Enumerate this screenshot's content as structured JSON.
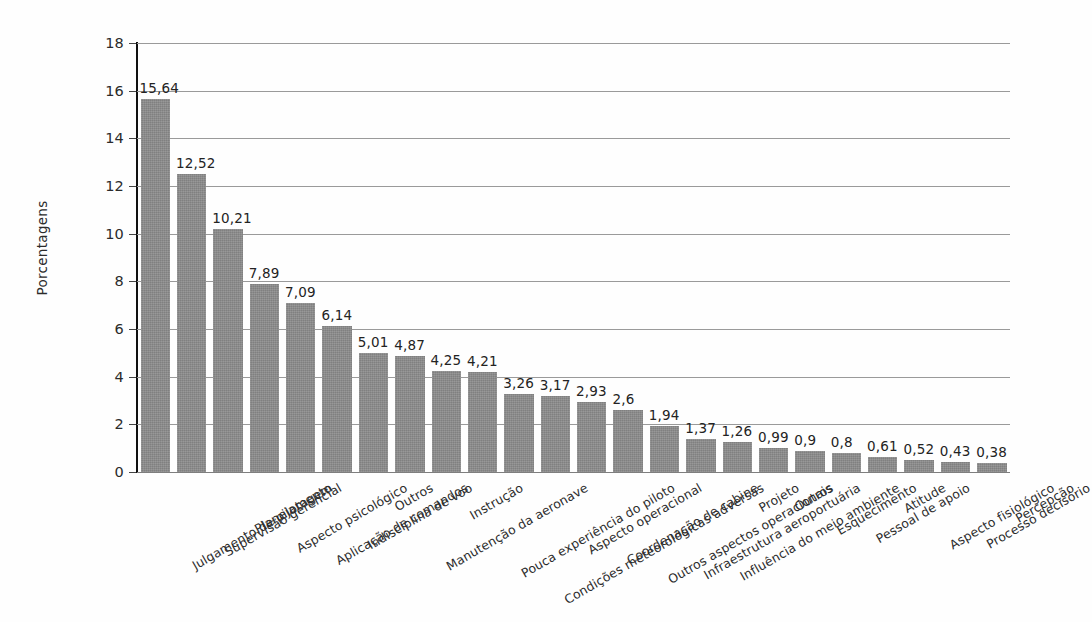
{
  "chart_data": {
    "type": "bar",
    "title": "",
    "subtitle": "",
    "xlabel": "",
    "ylabel": "Porcentagens",
    "ylim": [
      0,
      18
    ],
    "ytick_labels": [
      "0",
      "2",
      "4",
      "6",
      "8",
      "10",
      "12",
      "14",
      "16",
      "18"
    ],
    "yticks": [
      0,
      2,
      4,
      6,
      8,
      10,
      12,
      14,
      16,
      18
    ],
    "grid": "horizontal",
    "legend": "none",
    "orientation": "vertical",
    "bar_color": "#8d8d8d",
    "decimal_separator": ",",
    "categories": [
      "Julgamento de pilotagem",
      "Supervisão gerencial",
      "Planejamento",
      "Aspecto psicológico",
      "Aplicação de comandos",
      "Indisciplina de voo",
      "Outros",
      "Manutenção da aeronave",
      "Instrução",
      "Pouca experiência do piloto",
      "Condições meteorológicas adversas",
      "Aspecto operacional",
      "Coordenação de cabine",
      "Outros aspectos operacionais",
      "Infraestrutura aeroportuária",
      "Influência do meio ambiente",
      "Projeto",
      "Outros",
      "Esquecimento",
      "Pessoal de apoio",
      "Atitude",
      "Aspecto fisiológico",
      "Processo decisório",
      "Percepção"
    ],
    "values": [
      15.64,
      12.52,
      10.21,
      7.89,
      7.09,
      6.14,
      5.01,
      4.87,
      4.25,
      4.21,
      3.26,
      3.17,
      2.93,
      2.6,
      1.94,
      1.37,
      1.26,
      0.99,
      0.9,
      0.8,
      0.61,
      0.52,
      0.43,
      0.38
    ],
    "value_labels": [
      "15,64",
      "12,52",
      "10,21",
      "7,89",
      "7,09",
      "6,14",
      "5,01",
      "4,87",
      "4,25",
      "4,21",
      "3,26",
      "3,17",
      "2,93",
      "2,6",
      "1,94",
      "1,37",
      "1,26",
      "0,99",
      "0,9",
      "0,8",
      "0,61",
      "0,52",
      "0,43",
      "0,38"
    ]
  }
}
